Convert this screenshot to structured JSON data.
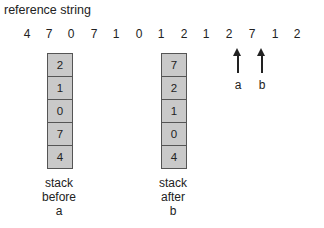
{
  "title": "reference string",
  "reference_string": [
    "4",
    "7",
    "0",
    "7",
    "1",
    "0",
    "1",
    "2",
    "1",
    "2",
    "7",
    "1",
    "2"
  ],
  "stack_before": {
    "cells": [
      "2",
      "1",
      "0",
      "7",
      "4"
    ],
    "caption_line1": "stack",
    "caption_line2": "before",
    "caption_line3": "a"
  },
  "stack_after": {
    "cells": [
      "7",
      "2",
      "1",
      "0",
      "4"
    ],
    "caption_line1": "stack",
    "caption_line2": "after",
    "caption_line3": "b"
  },
  "markers": [
    {
      "label": "a",
      "points_to_index": 9
    },
    {
      "label": "b",
      "points_to_index": 10
    }
  ],
  "colors": {
    "cell_fill": "#c9c9c9",
    "border": "#555555",
    "text": "#222222"
  }
}
